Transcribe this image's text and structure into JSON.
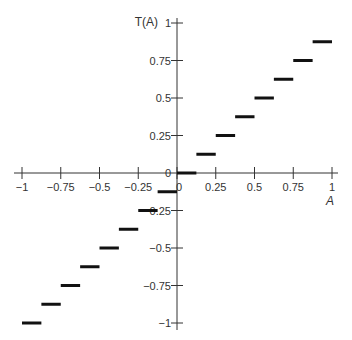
{
  "chart_data": {
    "type": "line",
    "subtype": "step",
    "title": "",
    "xlabel": "A",
    "ylabel": "T(A)",
    "xlim": [
      -1,
      1
    ],
    "ylim": [
      -1,
      1
    ],
    "grid": false,
    "x_ticks": [
      -1,
      -0.75,
      -0.5,
      -0.25,
      0,
      0.25,
      0.5,
      0.75,
      1
    ],
    "x_tick_labels": [
      "−1",
      "−0.75",
      "−0.5",
      "−0.25",
      "0",
      "0.25",
      "0.5",
      "0.75",
      "1"
    ],
    "y_ticks": [
      -1,
      -0.75,
      -0.5,
      -0.25,
      0,
      0.25,
      0.5,
      0.75,
      1
    ],
    "y_tick_labels": [
      "−1",
      "−0.75",
      "−0.5",
      "−0.25",
      "0",
      "0.25",
      "0.5",
      "0.75",
      "1"
    ],
    "series": [
      {
        "name": "T(A)",
        "segments": [
          {
            "x0": -1.0,
            "x1": -0.875,
            "y": -1.0
          },
          {
            "x0": -0.875,
            "x1": -0.75,
            "y": -0.875
          },
          {
            "x0": -0.75,
            "x1": -0.625,
            "y": -0.75
          },
          {
            "x0": -0.625,
            "x1": -0.5,
            "y": -0.625
          },
          {
            "x0": -0.5,
            "x1": -0.375,
            "y": -0.5
          },
          {
            "x0": -0.375,
            "x1": -0.25,
            "y": -0.375
          },
          {
            "x0": -0.25,
            "x1": -0.125,
            "y": -0.25
          },
          {
            "x0": -0.125,
            "x1": 0.0,
            "y": -0.125
          },
          {
            "x0": 0.0,
            "x1": 0.125,
            "y": 0.0
          },
          {
            "x0": 0.125,
            "x1": 0.25,
            "y": 0.125
          },
          {
            "x0": 0.25,
            "x1": 0.375,
            "y": 0.25
          },
          {
            "x0": 0.375,
            "x1": 0.5,
            "y": 0.375
          },
          {
            "x0": 0.5,
            "x1": 0.625,
            "y": 0.5
          },
          {
            "x0": 0.625,
            "x1": 0.75,
            "y": 0.625
          },
          {
            "x0": 0.75,
            "x1": 0.875,
            "y": 0.75
          },
          {
            "x0": 0.875,
            "x1": 1.0,
            "y": 0.875
          }
        ]
      }
    ],
    "colors": {
      "axis": "#333333",
      "series": "#111111"
    }
  }
}
